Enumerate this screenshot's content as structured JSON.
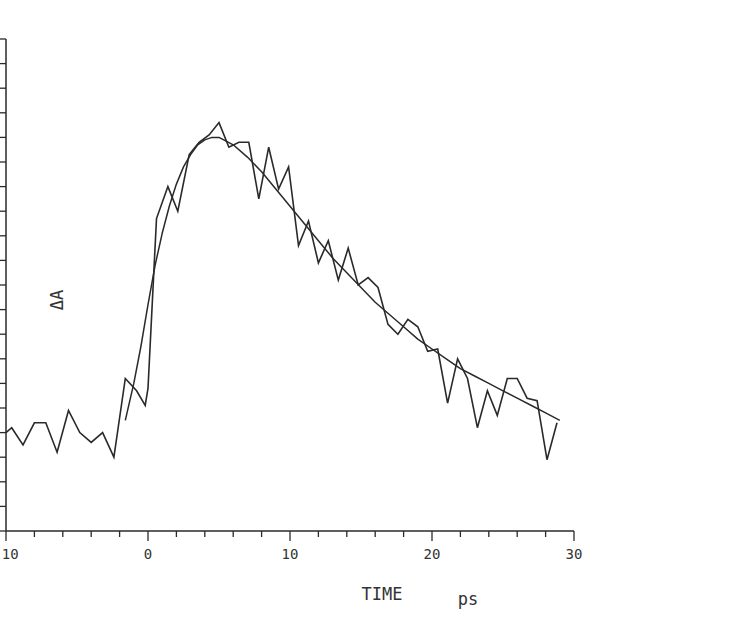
{
  "chart_data": {
    "type": "line",
    "title": "",
    "xlabel": "TIME",
    "xlabel_unit": "ps",
    "ylabel": "ΔA",
    "xlim": [
      -10,
      30
    ],
    "ylim": [
      -0.05,
      0.15
    ],
    "x_ticks": [
      -10,
      0,
      10,
      20,
      30
    ],
    "x_tick_labels": [
      "-10",
      "0",
      "10",
      "20",
      "30"
    ],
    "x_minor_step": 2,
    "y_ticks": [
      -0.05,
      0.0,
      0.05,
      0.1,
      0.15
    ],
    "y_tick_labels": [
      "-0.05",
      "0.00",
      "0.05",
      "0.10",
      "0.15"
    ],
    "y_minor_step": 0.01,
    "grid": false,
    "legend": null,
    "series": [
      {
        "name": "measured",
        "style": "jagged",
        "x": [
          -10,
          -9.6,
          -8.8,
          -8.0,
          -7.2,
          -6.4,
          -5.6,
          -4.8,
          -4.0,
          -3.2,
          -2.4,
          -1.6,
          -0.8,
          -0.2,
          0.0,
          0.6,
          1.4,
          2.1,
          2.9,
          3.6,
          4.3,
          5.0,
          5.7,
          6.4,
          7.1,
          7.8,
          8.5,
          9.2,
          9.9,
          10.6,
          11.3,
          12.0,
          12.7,
          13.4,
          14.1,
          14.8,
          15.5,
          16.2,
          16.9,
          17.6,
          18.3,
          19.0,
          19.7,
          20.4,
          21.1,
          21.8,
          22.5,
          23.2,
          23.9,
          24.6,
          25.3,
          26.0,
          26.7,
          27.4,
          28.1,
          28.8
        ],
        "y": [
          -0.01,
          -0.008,
          -0.015,
          -0.006,
          -0.006,
          -0.018,
          -0.001,
          -0.01,
          -0.014,
          -0.01,
          -0.02,
          0.012,
          0.007,
          0.001,
          0.008,
          0.077,
          0.09,
          0.08,
          0.103,
          0.108,
          0.111,
          0.116,
          0.106,
          0.108,
          0.108,
          0.085,
          0.106,
          0.089,
          0.098,
          0.066,
          0.076,
          0.059,
          0.068,
          0.052,
          0.065,
          0.05,
          0.053,
          0.049,
          0.034,
          0.03,
          0.036,
          0.033,
          0.023,
          0.024,
          0.002,
          0.02,
          0.012,
          -0.008,
          0.007,
          -0.003,
          0.012,
          0.012,
          0.004,
          0.003,
          -0.021,
          -0.006
        ]
      },
      {
        "name": "fit",
        "style": "smooth",
        "x": [
          -1.6,
          -1.0,
          -0.5,
          0.0,
          0.5,
          1.0,
          1.5,
          2.0,
          2.5,
          3.0,
          3.5,
          4.0,
          4.5,
          5.0,
          6.0,
          7.0,
          8.0,
          9.0,
          10.0,
          11.0,
          12.0,
          13.0,
          14.0,
          15.0,
          16.0,
          17.0,
          18.0,
          19.0,
          20.0,
          21.0,
          22.0,
          23.0,
          24.0,
          25.0,
          26.0,
          27.0,
          28.0,
          29.0
        ],
        "y": [
          -0.005,
          0.01,
          0.025,
          0.042,
          0.058,
          0.071,
          0.082,
          0.091,
          0.098,
          0.103,
          0.107,
          0.109,
          0.11,
          0.11,
          0.107,
          0.102,
          0.096,
          0.089,
          0.082,
          0.075,
          0.068,
          0.061,
          0.055,
          0.049,
          0.043,
          0.038,
          0.033,
          0.028,
          0.024,
          0.02,
          0.016,
          0.013,
          0.01,
          0.007,
          0.004,
          0.001,
          -0.002,
          -0.005
        ]
      }
    ]
  },
  "plot": {
    "origin_px": {
      "x": 148,
      "y": 408
    },
    "x_px_per_unit": 14.2,
    "y_px_per_unit": 2460,
    "ink_color": "#2a2a2a"
  }
}
